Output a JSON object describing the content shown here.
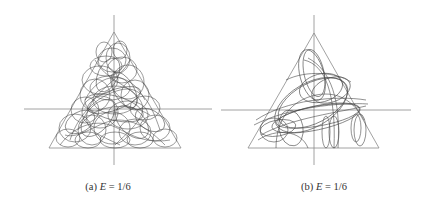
{
  "figure": {
    "panels": [
      {
        "id": "a",
        "label": "(a)",
        "variable": "E",
        "equals": "=",
        "value": "1/6",
        "caption": "(a) E = 1/6",
        "trajectory_density": "dense"
      },
      {
        "id": "b",
        "label": "(b)",
        "variable": "E",
        "equals": "=",
        "value": "1/6",
        "caption": "(b) E = 1/6",
        "trajectory_density": "sparse"
      }
    ],
    "colors": {
      "axes": "#8a8a8a",
      "triangle": "#8a8a8a",
      "trajectory": "#2a2a2a",
      "caption": "#333333"
    }
  }
}
